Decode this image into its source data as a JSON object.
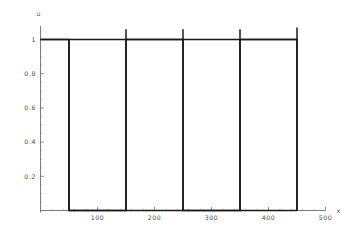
{
  "chart_data": {
    "type": "line",
    "title": "",
    "subtitle": "",
    "xlabel": "x",
    "ylabel": "u",
    "xlim": [
      0,
      500
    ],
    "ylim": [
      0,
      1.08
    ],
    "grid": false,
    "legend": null,
    "x_ticks": [
      {
        "value": 100,
        "label": "100"
      },
      {
        "value": 200,
        "label": "200"
      },
      {
        "value": 300,
        "label": "300"
      },
      {
        "value": 400,
        "label": "400"
      },
      {
        "value": 500,
        "label": "500"
      }
    ],
    "x_minor_ticks": [
      20,
      40,
      60,
      80,
      120,
      140,
      160,
      180,
      220,
      240,
      260,
      280,
      320,
      340,
      360,
      380,
      420,
      440,
      460,
      480
    ],
    "y_ticks": [
      {
        "value": 1,
        "label": "1"
      },
      {
        "value": 0.8,
        "label": "0.8"
      },
      {
        "value": 0.6,
        "label": "0.6"
      },
      {
        "value": 0.4,
        "label": "0.4"
      },
      {
        "value": 0.2,
        "label": "0.2"
      }
    ],
    "y_minor_ticks": [
      0.05,
      0.1,
      0.15,
      0.25,
      0.3,
      0.35,
      0.45,
      0.5,
      0.55,
      0.65,
      0.7,
      0.75,
      0.85,
      0.9,
      0.95,
      1.05
    ],
    "series": [
      {
        "name": "u(x)",
        "color": "#1a1a1a",
        "line_width": 1.6,
        "description": "square-wave pulse train, amplitude 1, period 200, transitions at x = 50, 150, 250, 350, 450",
        "points": [
          [
            0,
            1
          ],
          [
            50,
            1
          ],
          [
            50,
            0
          ],
          [
            150,
            0
          ],
          [
            150,
            1
          ],
          [
            250,
            1
          ],
          [
            250,
            0
          ],
          [
            350,
            0
          ],
          [
            350,
            1
          ],
          [
            450,
            1
          ],
          [
            450,
            0
          ]
        ]
      }
    ],
    "overlay_segments": [
      {
        "name": "top-plateau-line",
        "x1": 0,
        "y1": 1,
        "x2": 450,
        "y2": 1
      },
      {
        "name": "bottom-baseline-line",
        "x1": 50,
        "y1": 0,
        "x2": 450,
        "y2": 0
      }
    ],
    "vertical_jumps": [
      {
        "name": "jump-1",
        "x": 50,
        "y_bottom": 0,
        "y_top": 1.0,
        "overshoot": false
      },
      {
        "name": "jump-2",
        "x": 150,
        "y_bottom": 0,
        "y_top": 1.06,
        "overshoot": true
      },
      {
        "name": "jump-3",
        "x": 250,
        "y_bottom": 0,
        "y_top": 1.06,
        "overshoot": true
      },
      {
        "name": "jump-4",
        "x": 350,
        "y_bottom": 0,
        "y_top": 1.06,
        "overshoot": true
      },
      {
        "name": "jump-5",
        "x": 450,
        "y_bottom": 0,
        "y_top": 1.07,
        "overshoot": true
      }
    ],
    "axis_color": "#6e6e6e",
    "curve_color": "#1a1a1a",
    "background_color": "#ffffff"
  }
}
